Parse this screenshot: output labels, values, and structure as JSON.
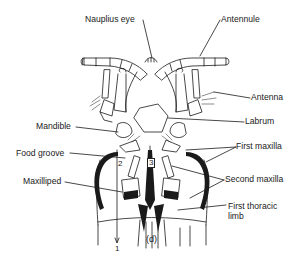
{
  "figure": {
    "caption": "(d)",
    "labels": {
      "nauplius_eye": "Nauplius eye",
      "antennule": "Antennule",
      "antenna": "Antenna",
      "labrum": "Labrum",
      "mandible": "Mandible",
      "first_maxilla": "First maxilla",
      "food_groove": "Food groove",
      "second_maxilla": "Second maxilla",
      "maxilliped": "Maxilliped",
      "first_thoracic_limb_line1": "First thoracic",
      "first_thoracic_limb_line2": "limb"
    },
    "flow_markers": [
      "1",
      "2",
      "3"
    ],
    "colors": {
      "ink": "#1a1a1a",
      "background": "#ffffff"
    }
  }
}
